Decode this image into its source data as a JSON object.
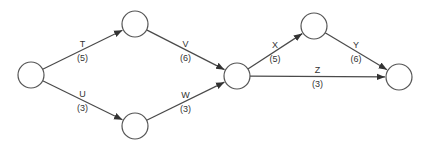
{
  "diagram": {
    "type": "activity-on-arrow network",
    "nodes": [
      {
        "id": "n1",
        "cx": 31,
        "cy": 75,
        "r": 13
      },
      {
        "id": "n2",
        "cx": 135,
        "cy": 24,
        "r": 13
      },
      {
        "id": "n3",
        "cx": 135,
        "cy": 126,
        "r": 13
      },
      {
        "id": "n4",
        "cx": 237,
        "cy": 76,
        "r": 13
      },
      {
        "id": "n5",
        "cx": 314,
        "cy": 26,
        "r": 13
      },
      {
        "id": "n6",
        "cx": 399,
        "cy": 77,
        "r": 13
      }
    ],
    "edges": [
      {
        "activity": "T",
        "duration": "(5)",
        "from": "n1",
        "to": "n2"
      },
      {
        "activity": "U",
        "duration": "(3)",
        "from": "n1",
        "to": "n3"
      },
      {
        "activity": "V",
        "duration": "(6)",
        "from": "n2",
        "to": "n4"
      },
      {
        "activity": "W",
        "duration": "(3)",
        "from": "n3",
        "to": "n4"
      },
      {
        "activity": "X",
        "duration": "(5)",
        "from": "n4",
        "to": "n5"
      },
      {
        "activity": "Y",
        "duration": "(6)",
        "from": "n5",
        "to": "n6"
      },
      {
        "activity": "Z",
        "duration": "(3)",
        "from": "n4",
        "to": "n6"
      }
    ]
  }
}
